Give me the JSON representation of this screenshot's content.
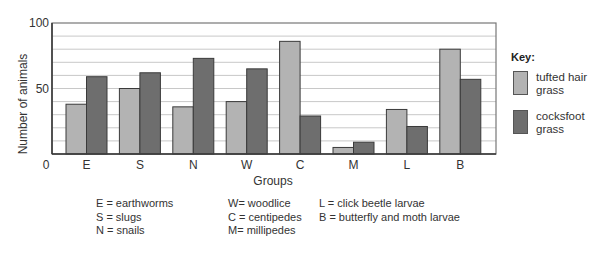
{
  "chart_data": {
    "type": "bar",
    "title": "",
    "xlabel": "Groups",
    "ylabel": "Number of animals",
    "ylim": [
      0,
      100
    ],
    "yticks": [
      0,
      50,
      100
    ],
    "grid": true,
    "grid_step": 10,
    "legend_position": "right",
    "legend_title": "Key:",
    "categories": [
      "E",
      "S",
      "N",
      "W",
      "C",
      "M",
      "L",
      "B"
    ],
    "series": [
      {
        "name": "tufted hair grass",
        "color": "#b3b3b3",
        "values": [
          38,
          50,
          36,
          40,
          86,
          5,
          34,
          80
        ]
      },
      {
        "name": "cocksfoot grass",
        "color": "#6e6e6e",
        "values": [
          59,
          62,
          73,
          65,
          29,
          9,
          21,
          57
        ]
      }
    ],
    "annotations": [
      "E = earthworms",
      "S = slugs",
      "N = snails",
      "W= woodlice",
      "C = centipedes",
      "M= millipedes",
      "L = click beetle larvae",
      "B = butterfly and moth larvae"
    ]
  },
  "key": {
    "title": "Key:",
    "items": [
      {
        "label": "tufted hair grass",
        "color": "#b3b3b3"
      },
      {
        "label": "cocksfoot grass",
        "color": "#6e6e6e"
      }
    ]
  },
  "abbreviations": {
    "col1": [
      "E = earthworms",
      "S = slugs",
      "N = snails"
    ],
    "col2": [
      "W= woodlice",
      "C = centipedes",
      "M= millipedes"
    ],
    "col3": [
      "L = click beetle larvae",
      "B = butterfly and moth larvae"
    ]
  }
}
